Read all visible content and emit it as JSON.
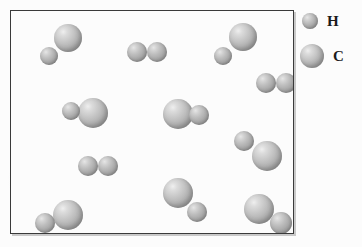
{
  "figure": {
    "kind": "molecular-particle-diagram",
    "background_color": "#fcfcfc",
    "border_color": "#3a3a3a",
    "atom_fill_light": "#efefef",
    "atom_fill_dark": "#8a8a8a"
  },
  "legend": {
    "items": [
      {
        "label": "H",
        "icon": "small-gray-sphere",
        "radius": 8,
        "cx": 10,
        "cy": 13
      },
      {
        "label": "C",
        "icon": "large-gray-sphere",
        "radius": 12,
        "cx": 12,
        "cy": 48
      }
    ]
  },
  "container": {
    "x": 10,
    "y": 10,
    "width": 284,
    "height": 224
  },
  "particles": [
    {
      "id": "molecule-1",
      "type": "CH",
      "atoms": [
        {
          "element": "C",
          "cx": 57,
          "cy": 27,
          "r": 14
        },
        {
          "element": "H",
          "cx": 38,
          "cy": 45,
          "r": 9
        }
      ]
    },
    {
      "id": "molecule-2",
      "type": "H2",
      "atoms": [
        {
          "element": "H",
          "cx": 126,
          "cy": 41,
          "r": 10
        },
        {
          "element": "H",
          "cx": 146,
          "cy": 41,
          "r": 10
        }
      ]
    },
    {
      "id": "molecule-3",
      "type": "CH",
      "atoms": [
        {
          "element": "C",
          "cx": 232,
          "cy": 26,
          "r": 14
        },
        {
          "element": "H",
          "cx": 212,
          "cy": 45,
          "r": 9
        }
      ]
    },
    {
      "id": "molecule-4",
      "type": "H2",
      "atoms": [
        {
          "element": "H",
          "cx": 255,
          "cy": 72,
          "r": 10
        },
        {
          "element": "H",
          "cx": 275,
          "cy": 72,
          "r": 10
        }
      ]
    },
    {
      "id": "molecule-5",
      "type": "CH",
      "atoms": [
        {
          "element": "H",
          "cx": 60,
          "cy": 100,
          "r": 9
        },
        {
          "element": "C",
          "cx": 82,
          "cy": 102,
          "r": 15
        }
      ]
    },
    {
      "id": "molecule-6",
      "type": "CH",
      "atoms": [
        {
          "element": "C",
          "cx": 167,
          "cy": 103,
          "r": 15
        },
        {
          "element": "H",
          "cx": 188,
          "cy": 104,
          "r": 10
        }
      ]
    },
    {
      "id": "molecule-7",
      "type": "CH",
      "atoms": [
        {
          "element": "H",
          "cx": 233,
          "cy": 130,
          "r": 10
        },
        {
          "element": "C",
          "cx": 256,
          "cy": 145,
          "r": 15
        }
      ]
    },
    {
      "id": "molecule-8",
      "type": "H2",
      "atoms": [
        {
          "element": "H",
          "cx": 77,
          "cy": 155,
          "r": 10
        },
        {
          "element": "H",
          "cx": 97,
          "cy": 155,
          "r": 10
        }
      ]
    },
    {
      "id": "molecule-9",
      "type": "CH",
      "atoms": [
        {
          "element": "C",
          "cx": 167,
          "cy": 182,
          "r": 15
        },
        {
          "element": "H",
          "cx": 186,
          "cy": 201,
          "r": 10
        }
      ]
    },
    {
      "id": "molecule-10",
      "type": "CH",
      "atoms": [
        {
          "element": "C",
          "cx": 248,
          "cy": 198,
          "r": 15
        },
        {
          "element": "H",
          "cx": 270,
          "cy": 212,
          "r": 11
        }
      ]
    },
    {
      "id": "molecule-11",
      "type": "CH",
      "atoms": [
        {
          "element": "H",
          "cx": 34,
          "cy": 212,
          "r": 10
        },
        {
          "element": "C",
          "cx": 57,
          "cy": 204,
          "r": 15
        }
      ]
    }
  ],
  "counts": {
    "carbon_hydrogen_pairs": 8,
    "hydrogen_molecules": 3
  }
}
